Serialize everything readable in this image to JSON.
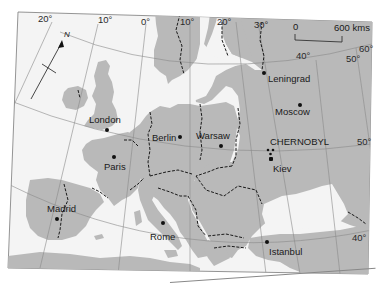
{
  "map": {
    "title": "Europe",
    "colors": {
      "land": "#b9b9b9",
      "sea": "#f4f4f4",
      "border": "#1a1a1a",
      "graticule": "#8a8a8a",
      "paper": "#ffffff"
    },
    "north_arrow": {
      "label": "N"
    },
    "scale_bar": {
      "start_label": "0",
      "end_label": "600 kms"
    },
    "longitude_labels": [
      "20°",
      "10°",
      "0°",
      "10°",
      "20°",
      "30°",
      "40°",
      "50°"
    ],
    "latitude_labels": [
      "60°",
      "50°",
      "40°"
    ],
    "cities": [
      {
        "name": "London",
        "x": 107,
        "y": 130
      },
      {
        "name": "Paris",
        "x": 114,
        "y": 157
      },
      {
        "name": "Berlin",
        "x": 180,
        "y": 138
      },
      {
        "name": "Warsaw",
        "x": 221,
        "y": 146
      },
      {
        "name": "Leningrad",
        "x": 264,
        "y": 73
      },
      {
        "name": "Moscow",
        "x": 300,
        "y": 105
      },
      {
        "name": "Kiev",
        "x": 271,
        "y": 158
      },
      {
        "name": "Madrid",
        "x": 57,
        "y": 218
      },
      {
        "name": "Rome",
        "x": 162,
        "y": 225
      },
      {
        "name": "Istanbul",
        "x": 267,
        "y": 241
      }
    ],
    "special_site": {
      "name": "CHERNOBYL",
      "icon": "radiation-hazard-icon"
    }
  }
}
